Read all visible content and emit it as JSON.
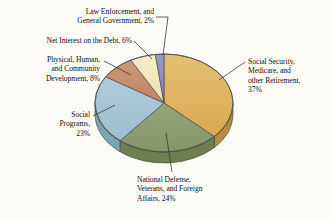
{
  "chart_data": {
    "type": "pie",
    "title": "",
    "subtitle": "",
    "xlabel": "",
    "ylabel": "",
    "grid": false,
    "legend_position": "none",
    "style": "3d-exploded-none",
    "start_angle_deg": 0,
    "direction": "clockwise",
    "categories": [
      "Social Security, Medicare, and other Retirement",
      "National Defense, Veterans, and Foreign Affairs",
      "Social Programs",
      "Physical, Human, and Community Development",
      "Net Interest on the Debt",
      "Law Enforcement, and General Government"
    ],
    "values": [
      37,
      24,
      23,
      8,
      6,
      2
    ],
    "value_unit": "%",
    "colors": [
      "#e0b464",
      "#8fa072",
      "#a8c6d4",
      "#c98f6f",
      "#f2e6bd",
      "#8f8fc0"
    ],
    "slices": [
      {
        "name": "social-security",
        "label": "Social Security, Medicare, and other Retirement",
        "value": 37,
        "display": "37%",
        "color": "#e0b464"
      },
      {
        "name": "national-defense",
        "label": "National Defense, Veterans, and Foreign Affairs",
        "value": 24,
        "display": "24%",
        "color": "#8fa072"
      },
      {
        "name": "social-programs",
        "label": "Social Programs",
        "value": 23,
        "display": "23%",
        "color": "#a8c6d4"
      },
      {
        "name": "physical-human",
        "label": "Physical, Human, and Community Development",
        "value": 8,
        "display": "8%",
        "color": "#c98f6f"
      },
      {
        "name": "net-interest",
        "label": "Net Interest on the Debt",
        "value": 6,
        "display": "6%",
        "color": "#f2e6bd"
      },
      {
        "name": "law-enforcement",
        "label": "Law Enforcement, and General Government",
        "value": 2,
        "display": "2%",
        "color": "#8f8fc0"
      }
    ]
  },
  "labels": {
    "law_enforcement": "Law Enforcement, and\nGeneral Government, 2%",
    "net_interest": "Net Interest on the Debt, 6%",
    "physical_human": "Physical, Human,\nand Community\nDevelopment, 8%",
    "social_programs": "Social\nPrograms,\n23%",
    "national_defense": "National Defense,\nVeterans, and Foreign\nAffairs, 24%",
    "social_security": "Social Security,\nMedicare, and\nother Retirement,\n37%"
  },
  "colors": {
    "background": "#fdfcf7",
    "outline": "#4a4a4a",
    "leader_line": "#3a3a3a",
    "text": "#111111"
  }
}
